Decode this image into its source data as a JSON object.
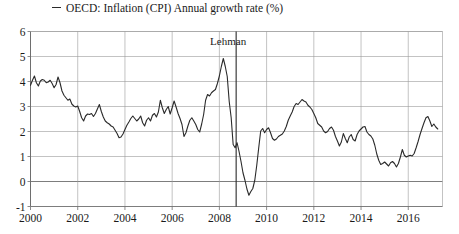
{
  "legend": {
    "marker": "line-dash-marker",
    "label": "OECD: Inflation (CPI) Annual growth rate (%)"
  },
  "annotation": {
    "lehman_label": "Lehman",
    "lehman_x": 2008.71
  },
  "axis": {
    "y_ticks": [
      "6",
      "5",
      "4",
      "3",
      "2",
      "1",
      "0",
      "-1"
    ],
    "x_ticks": [
      "2000",
      "2002",
      "2004",
      "2006",
      "2008",
      "2010",
      "2012",
      "2014",
      "2016"
    ]
  },
  "colors": {
    "line": "#2a2a2a",
    "grid": "#9a9a9a",
    "frame": "#6e6e6e",
    "text": "#1a1a1a",
    "background": "#ffffff"
  },
  "chart_data": {
    "type": "line",
    "title": "",
    "xlabel": "",
    "ylabel": "",
    "xlim": [
      2000.0,
      2017.45
    ],
    "ylim": [
      -1,
      6
    ],
    "ytick_values": [
      6,
      5,
      4,
      3,
      2,
      1,
      0,
      -1
    ],
    "xtick_values": [
      2000,
      2002,
      2004,
      2006,
      2008,
      2010,
      2012,
      2014,
      2016
    ],
    "grid": true,
    "legend_position": "above-plot-left",
    "annotations": [
      {
        "text": "Lehman",
        "x": 2008.71,
        "type": "vertical-line-label"
      }
    ],
    "series": [
      {
        "name": "OECD: Inflation (CPI) Annual growth rate (%)",
        "x_start": 2000.0,
        "x_step": 0.08333,
        "values": [
          3.85,
          4.05,
          4.22,
          3.95,
          3.82,
          4.02,
          4.08,
          4.05,
          3.95,
          3.98,
          4.05,
          3.92,
          3.75,
          3.88,
          4.18,
          3.95,
          3.62,
          3.45,
          3.35,
          3.25,
          3.3,
          3.1,
          3.02,
          2.98,
          3.02,
          2.8,
          2.55,
          2.42,
          2.62,
          2.7,
          2.68,
          2.72,
          2.6,
          2.72,
          2.9,
          3.08,
          2.8,
          2.58,
          2.42,
          2.35,
          2.3,
          2.22,
          2.18,
          2.05,
          1.92,
          1.75,
          1.78,
          1.9,
          2.08,
          2.25,
          2.38,
          2.52,
          2.62,
          2.52,
          2.42,
          2.5,
          2.62,
          2.35,
          2.22,
          2.45,
          2.55,
          2.42,
          2.65,
          2.72,
          2.58,
          2.78,
          3.25,
          2.95,
          2.72,
          2.88,
          3.0,
          2.7,
          2.95,
          3.22,
          2.98,
          2.72,
          2.52,
          2.28,
          1.8,
          1.95,
          2.22,
          2.45,
          2.55,
          2.42,
          2.28,
          2.08,
          1.98,
          2.3,
          2.68,
          3.25,
          3.48,
          3.42,
          3.55,
          3.62,
          3.68,
          3.92,
          4.22,
          4.6,
          4.92,
          4.6,
          4.2,
          3.2,
          2.55,
          1.48,
          1.35,
          1.55,
          1.2,
          0.8,
          0.35,
          0.05,
          -0.3,
          -0.55,
          -0.4,
          -0.28,
          0.05,
          0.65,
          1.35,
          2.02,
          2.12,
          1.95,
          2.08,
          2.15,
          1.95,
          1.72,
          1.65,
          1.7,
          1.8,
          1.85,
          1.9,
          2.02,
          2.2,
          2.45,
          2.62,
          2.78,
          3.0,
          3.12,
          3.08,
          3.18,
          3.28,
          3.22,
          3.18,
          3.05,
          2.98,
          2.88,
          2.72,
          2.55,
          2.32,
          2.25,
          2.18,
          2.02,
          1.95,
          2.0,
          2.12,
          2.18,
          2.05,
          1.8,
          1.62,
          1.42,
          1.58,
          1.92,
          1.72,
          1.55,
          1.78,
          1.88,
          1.68,
          1.62,
          1.88,
          2.02,
          2.1,
          2.18,
          2.2,
          1.98,
          1.88,
          1.82,
          1.7,
          1.45,
          1.1,
          0.85,
          0.68,
          0.72,
          0.78,
          0.7,
          0.62,
          0.75,
          0.8,
          0.72,
          0.58,
          0.72,
          0.98,
          1.28,
          1.05,
          0.98,
          1.02,
          1.05,
          1.02,
          1.12,
          1.35,
          1.6,
          1.88,
          2.12,
          2.35,
          2.55,
          2.6,
          2.42,
          2.2,
          2.3,
          2.18,
          2.1
        ]
      }
    ]
  }
}
